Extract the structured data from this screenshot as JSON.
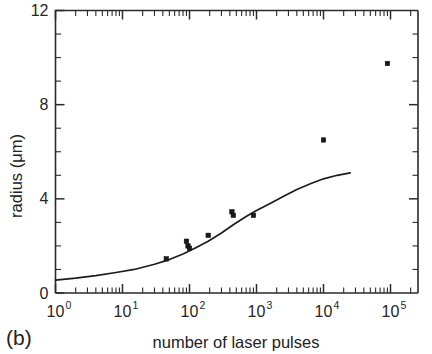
{
  "panel": {
    "label": "(b)"
  },
  "chart_data": {
    "type": "scatter",
    "title": "",
    "xlabel": "number of laser pulses",
    "ylabel": "radius (μm)",
    "xscale": "log",
    "yscale": "linear",
    "xlim": [
      1,
      251188
    ],
    "ylim": [
      0,
      12
    ],
    "grid": false,
    "legend": null,
    "x_tick_labels": [
      "10",
      "10",
      "10",
      "10",
      "10",
      "10"
    ],
    "x_tick_exponents": [
      "0",
      "1",
      "2",
      "3",
      "4",
      "5"
    ],
    "x_tick_values": [
      1,
      10,
      100,
      1000,
      10000,
      100000
    ],
    "y_tick_labels": [
      "0",
      "4",
      "8",
      "12"
    ],
    "y_tick_values": [
      0,
      4,
      8,
      12
    ],
    "y_minor_tick_values": [
      1,
      2,
      3,
      5,
      6,
      7,
      9,
      10,
      11
    ],
    "series": [
      {
        "name": "measured radius",
        "type": "scatter",
        "marker": "filled-square",
        "points": [
          {
            "x": 45,
            "y": 1.45
          },
          {
            "x": 90,
            "y": 2.2
          },
          {
            "x": 95,
            "y": 2.0
          },
          {
            "x": 100,
            "y": 1.9
          },
          {
            "x": 190,
            "y": 2.45
          },
          {
            "x": 430,
            "y": 3.45
          },
          {
            "x": 450,
            "y": 3.3
          },
          {
            "x": 900,
            "y": 3.3
          },
          {
            "x": 10000,
            "y": 6.5
          },
          {
            "x": 90000,
            "y": 9.75
          }
        ]
      },
      {
        "name": "model fit",
        "type": "line",
        "points": [
          {
            "x": 1,
            "y": 0.55
          },
          {
            "x": 2,
            "y": 0.63
          },
          {
            "x": 4,
            "y": 0.74
          },
          {
            "x": 8,
            "y": 0.87
          },
          {
            "x": 15,
            "y": 1.0
          },
          {
            "x": 30,
            "y": 1.22
          },
          {
            "x": 50,
            "y": 1.42
          },
          {
            "x": 80,
            "y": 1.66
          },
          {
            "x": 120,
            "y": 1.9
          },
          {
            "x": 190,
            "y": 2.2
          },
          {
            "x": 300,
            "y": 2.55
          },
          {
            "x": 450,
            "y": 2.9
          },
          {
            "x": 700,
            "y": 3.25
          },
          {
            "x": 1000,
            "y": 3.5
          },
          {
            "x": 1600,
            "y": 3.8
          },
          {
            "x": 2500,
            "y": 4.1
          },
          {
            "x": 4000,
            "y": 4.4
          },
          {
            "x": 6500,
            "y": 4.65
          },
          {
            "x": 10000,
            "y": 4.85
          },
          {
            "x": 16000,
            "y": 5.0
          },
          {
            "x": 25000,
            "y": 5.1
          }
        ]
      }
    ]
  }
}
